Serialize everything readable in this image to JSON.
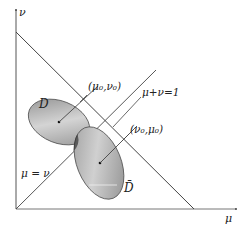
{
  "diagram": {
    "axes": {
      "x_label": "μ",
      "y_label": "ν"
    },
    "lines": {
      "anti_diagonal_label": "μ+ν=1",
      "diagonal_label": "μ = ν"
    },
    "regions": {
      "region_1_label": "D",
      "region_2_label": "D̄"
    },
    "points": {
      "point_1_label": "(μ₀,ν₀)",
      "point_2_label": "(ν₀,μ₀)"
    },
    "colors": {
      "axis": "#555555",
      "line": "#444444",
      "region_fill": "#a8a8a8",
      "overlap_fill": "#555555"
    }
  }
}
